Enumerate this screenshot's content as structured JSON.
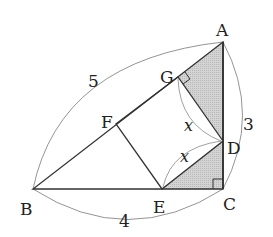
{
  "diagram": {
    "type": "geometry-figure",
    "points": {
      "A": {
        "label": "A",
        "x": 223,
        "y": 42
      },
      "B": {
        "label": "B",
        "x": 33,
        "y": 189
      },
      "C": {
        "label": "C",
        "x": 223,
        "y": 189
      },
      "D": {
        "label": "D",
        "x": 223,
        "y": 141
      },
      "E": {
        "label": "E",
        "x": 162,
        "y": 189
      },
      "F": {
        "label": "F",
        "x": 116,
        "y": 124
      },
      "G": {
        "label": "G",
        "x": 178,
        "y": 77
      }
    },
    "measurements": {
      "AB": "5",
      "AC": "3",
      "BC": "4",
      "GD": "x",
      "DE": "x"
    },
    "right_angles": [
      "G",
      "C"
    ],
    "shade_color": "#c8c8c8",
    "line_color": "#333333",
    "arc_color": "#777777"
  }
}
